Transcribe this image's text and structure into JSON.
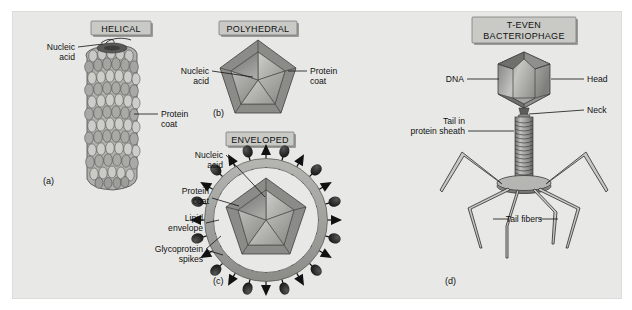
{
  "figure": {
    "background_color": "#ffffff",
    "panel_color": "#e8e8e6",
    "banner_color": "#c9c9c6",
    "ink_color": "#111111"
  },
  "panels": [
    {
      "key": "helical",
      "letter": "(a)",
      "banner": "HELICAL",
      "labels": [
        {
          "name": "nucleic-acid",
          "line1": "Nucleic",
          "line2": "acid"
        },
        {
          "name": "protein-coat",
          "line1": "Protein",
          "line2": "coat"
        }
      ]
    },
    {
      "key": "polyhedral",
      "letter": "(b)",
      "banner": "POLYHEDRAL",
      "labels": [
        {
          "name": "nucleic-acid",
          "line1": "Nucleic",
          "line2": "acid"
        },
        {
          "name": "protein-coat",
          "line1": "Protein",
          "line2": "coat"
        }
      ]
    },
    {
      "key": "enveloped",
      "letter": "(c)",
      "banner": "ENVELOPED",
      "labels": [
        {
          "name": "nucleic-acid",
          "line1": "Nucleic",
          "line2": "acid"
        },
        {
          "name": "protein-coat",
          "line1": "Protein",
          "line2": "coat"
        },
        {
          "name": "lipid-envelope",
          "line1": "Lipid",
          "line2": "envelope"
        },
        {
          "name": "glycoprotein-spikes",
          "line1": "Glycoprotein",
          "line2": "spikes"
        }
      ]
    },
    {
      "key": "bacteriophage",
      "letter": "(d)",
      "banner_line1": "T-EVEN",
      "banner_line2": "BACTERIOPHAGE",
      "labels": [
        {
          "name": "dna",
          "line1": "DNA"
        },
        {
          "name": "head",
          "line1": "Head"
        },
        {
          "name": "neck",
          "line1": "Neck"
        },
        {
          "name": "tail-in-protein-sheath",
          "line1": "Tail in",
          "line2": "protein sheath"
        },
        {
          "name": "tail-fibers",
          "line1": "Tail fibers"
        }
      ]
    }
  ]
}
